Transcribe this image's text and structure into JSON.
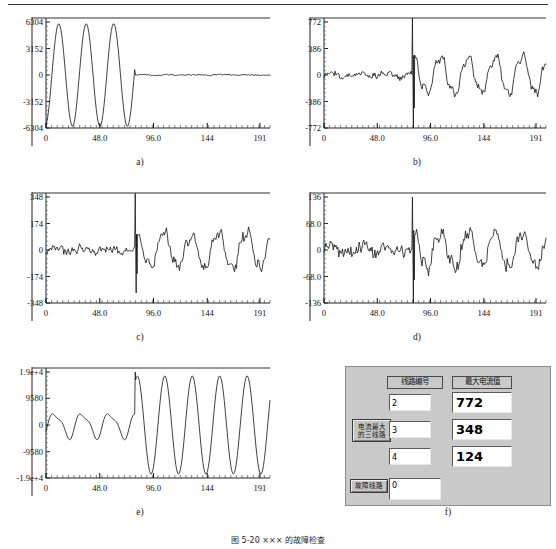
{
  "figure": {
    "caption": "图 5-20  ××× 的故障检查",
    "top_rule": true
  },
  "panels": [
    {
      "id": "a",
      "caption": "a)",
      "chart_data": {
        "type": "line",
        "title": "",
        "xlabel": "",
        "ylabel": "",
        "xlim": [
          0,
          200
        ],
        "ylim": [
          -6304,
          6304
        ],
        "xticks": [
          0,
          48.0,
          96.0,
          144,
          191
        ],
        "xtick_labels": [
          "0",
          "48.0",
          "96.0",
          "144",
          "191"
        ],
        "yticks": [
          -6304,
          -3152,
          0,
          3152,
          6304
        ],
        "ytick_labels": [
          "-6304",
          "-3152",
          "0",
          "3152",
          "6304"
        ],
        "grid": false,
        "legend": null,
        "series": [
          {
            "name": "line-current-a",
            "description": "large sinusoidal pre-fault current, collapsing to near-zero noise after the fault at t=80",
            "generator": {
              "kind": "sine-decay",
              "amplitude": 6100,
              "period": 24.5,
              "phase": -1.35,
              "fault_x": 80,
              "post_amplitude": 130,
              "post_noise": 95,
              "pre_noise": 0,
              "seed": 11
            }
          }
        ]
      }
    },
    {
      "id": "b",
      "caption": "b)",
      "chart_data": {
        "type": "line",
        "title": "",
        "xlabel": "",
        "ylabel": "",
        "xlim": [
          0,
          200
        ],
        "ylim": [
          -772,
          772
        ],
        "xticks": [
          0,
          48.0,
          96.0,
          144,
          191
        ],
        "xtick_labels": [
          "0",
          "48.0",
          "96.0",
          "144",
          "191"
        ],
        "yticks": [
          -772,
          -386,
          0,
          386,
          772
        ],
        "ytick_labels": [
          "-772",
          "-386",
          "0",
          "386",
          "772"
        ],
        "grid": false,
        "legend": null,
        "series": [
          {
            "name": "line-current-b",
            "description": "small noisy pre-fault current, spike at fault, larger oscillation after",
            "generator": {
              "kind": "noise-then-sine",
              "pre_amplitude": 30,
              "pre_noise": 48,
              "post_amplitude": 265,
              "post_noise": 70,
              "period": 24.5,
              "phase": -0.2,
              "fault_x": 80,
              "spike_up": 830,
              "spike_down": -870,
              "seed": 23
            }
          }
        ]
      }
    },
    {
      "id": "c",
      "caption": "c)",
      "chart_data": {
        "type": "line",
        "title": "",
        "xlabel": "",
        "ylabel": "",
        "xlim": [
          0,
          200
        ],
        "ylim": [
          -348,
          348
        ],
        "xticks": [
          0,
          48.0,
          96.0,
          144,
          191
        ],
        "xtick_labels": [
          "0",
          "48.0",
          "96.0",
          "144",
          "191"
        ],
        "yticks": [
          -348,
          -174,
          0,
          174,
          348
        ],
        "ytick_labels": [
          "-348",
          "-174",
          "0",
          "174",
          "348"
        ],
        "grid": false,
        "legend": null,
        "series": [
          {
            "name": "line-current-c",
            "description": "small noisy pre-fault current, spike at fault, moderate oscillation after",
            "generator": {
              "kind": "noise-then-sine",
              "pre_amplitude": 14,
              "pre_noise": 30,
              "post_amplitude": 112,
              "post_noise": 40,
              "period": 24.5,
              "phase": -0.25,
              "fault_x": 80,
              "spike_up": 372,
              "spike_down": -282,
              "seed": 37
            }
          }
        ]
      }
    },
    {
      "id": "d",
      "caption": "d)",
      "chart_data": {
        "type": "line",
        "title": "",
        "xlabel": "",
        "ylabel": "",
        "xlim": [
          0,
          200
        ],
        "ylim": [
          -136,
          136
        ],
        "xticks": [
          0,
          48.0,
          96.0,
          144,
          191
        ],
        "xtick_labels": [
          "0",
          "48.0",
          "96.0",
          "144",
          "191"
        ],
        "yticks": [
          -136,
          -68.0,
          0,
          68.0,
          136
        ],
        "ytick_labels": [
          "-136",
          "-68.0",
          "0",
          "68.0",
          "136"
        ],
        "grid": false,
        "legend": null,
        "series": [
          {
            "name": "line-current-d",
            "description": "small noisy pre-fault current, narrow spike at fault, oscillation after",
            "generator": {
              "kind": "noise-then-sine",
              "pre_amplitude": 8,
              "pre_noise": 20,
              "post_amplitude": 48,
              "post_noise": 22,
              "period": 24.5,
              "phase": -0.3,
              "fault_x": 80,
              "spike_up": 136,
              "spike_down": -140,
              "seed": 53
            }
          }
        ]
      }
    },
    {
      "id": "e",
      "caption": "e)",
      "chart_data": {
        "type": "line",
        "title": "",
        "xlabel": "",
        "ylabel": "",
        "xlim": [
          0,
          200
        ],
        "ylim": [
          -19000,
          19000
        ],
        "xticks": [
          0,
          48.0,
          96.0,
          144,
          191
        ],
        "xtick_labels": [
          "0",
          "48.0",
          "96.0",
          "144",
          "191"
        ],
        "yticks": [
          -19000,
          -9580,
          0,
          9580,
          19000
        ],
        "ytick_labels": [
          "-1.9e+4",
          "-9580",
          "0",
          "9580",
          "1.9e+4"
        ],
        "grid": false,
        "legend": null,
        "series": [
          {
            "name": "source-current-e",
            "description": "moderate pre-fault oscillation growing into large sustained sinusoid after the fault",
            "generator": {
              "kind": "sine-grow",
              "pre_amplitude": 4200,
              "post_amplitude": 17600,
              "period": 24.5,
              "phase": -0.5,
              "fault_x": 80,
              "spike_up": 19000,
              "seed": 67
            }
          }
        ]
      }
    }
  ],
  "dialog": {
    "caption": "f)",
    "column_headers": {
      "line_number": "线路编号",
      "max_current": "最大电流值"
    },
    "buttons": {
      "top_three": [
        "电流最大",
        "的三线路"
      ],
      "fault_line": "故障线路"
    },
    "rows": [
      {
        "line_number": "2",
        "max_current": "772"
      },
      {
        "line_number": "3",
        "max_current": "348"
      },
      {
        "line_number": "4",
        "max_current": "124"
      }
    ],
    "fault_output": "0"
  }
}
